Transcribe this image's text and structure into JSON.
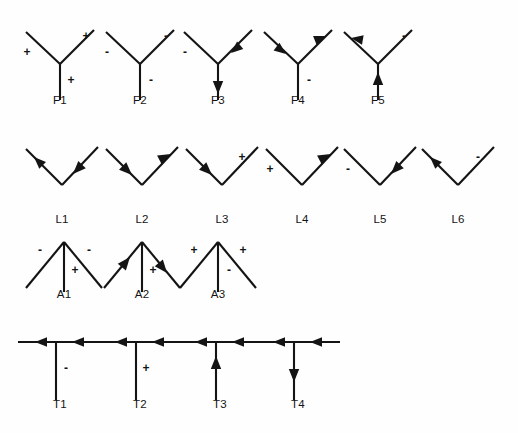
{
  "page": {
    "background_color": "#fefefe",
    "ink_color": "#141414"
  },
  "rows": [
    {
      "id": "row-fork",
      "family": "F",
      "junction_type": "fork",
      "y": 14,
      "figures": [
        {
          "label": "F1",
          "x": 14,
          "shape": "fork",
          "marks": [
            {
              "branch": "left",
              "kind": "sign",
              "value": "+"
            },
            {
              "branch": "right",
              "kind": "sign",
              "value": "+"
            },
            {
              "branch": "stem",
              "kind": "sign",
              "value": "+"
            }
          ]
        },
        {
          "label": "F2",
          "x": 94,
          "shape": "fork",
          "marks": [
            {
              "branch": "left",
              "kind": "sign",
              "value": "-"
            },
            {
              "branch": "right",
              "kind": "sign",
              "value": "-"
            },
            {
              "branch": "stem",
              "kind": "sign",
              "value": "-"
            }
          ]
        },
        {
          "label": "F3",
          "x": 172,
          "shape": "fork",
          "marks": [
            {
              "branch": "left",
              "kind": "sign",
              "value": "-"
            },
            {
              "branch": "right",
              "kind": "arrow",
              "value": "inward"
            },
            {
              "branch": "stem",
              "kind": "arrow",
              "value": "down"
            }
          ]
        },
        {
          "label": "F4",
          "x": 252,
          "shape": "fork",
          "marks": [
            {
              "branch": "left",
              "kind": "arrow",
              "value": "inward"
            },
            {
              "branch": "right",
              "kind": "arrow",
              "value": "outward"
            },
            {
              "branch": "stem",
              "kind": "sign",
              "value": "-"
            }
          ]
        },
        {
          "label": "F5",
          "x": 332,
          "shape": "fork",
          "marks": [
            {
              "branch": "left",
              "kind": "arrow",
              "value": "outward"
            },
            {
              "branch": "right",
              "kind": "sign",
              "value": "-"
            },
            {
              "branch": "stem",
              "kind": "arrow",
              "value": "up"
            }
          ]
        }
      ]
    },
    {
      "id": "row-ell",
      "family": "L",
      "junction_type": "ell",
      "y": 133,
      "figures": [
        {
          "label": "L1",
          "x": 16,
          "shape": "ell",
          "marks": [
            {
              "branch": "left",
              "kind": "arrow",
              "value": "outward"
            },
            {
              "branch": "right",
              "kind": "arrow",
              "value": "inward"
            }
          ]
        },
        {
          "label": "L2",
          "x": 96,
          "shape": "ell",
          "marks": [
            {
              "branch": "left",
              "kind": "arrow",
              "value": "inward"
            },
            {
              "branch": "right",
              "kind": "arrow",
              "value": "outward"
            }
          ]
        },
        {
          "label": "L3",
          "x": 176,
          "shape": "ell",
          "marks": [
            {
              "branch": "left",
              "kind": "arrow",
              "value": "inward"
            },
            {
              "branch": "right",
              "kind": "sign",
              "value": "+"
            }
          ]
        },
        {
          "label": "L4",
          "x": 256,
          "shape": "ell",
          "marks": [
            {
              "branch": "left",
              "kind": "sign",
              "value": "+"
            },
            {
              "branch": "right",
              "kind": "arrow",
              "value": "outward"
            }
          ]
        },
        {
          "label": "L5",
          "x": 334,
          "shape": "ell",
          "marks": [
            {
              "branch": "left",
              "kind": "sign",
              "value": "-"
            },
            {
              "branch": "right",
              "kind": "arrow",
              "value": "inward"
            }
          ]
        },
        {
          "label": "L6",
          "x": 412,
          "shape": "ell",
          "marks": [
            {
              "branch": "left",
              "kind": "arrow",
              "value": "outward"
            },
            {
              "branch": "right",
              "kind": "sign",
              "value": "-"
            }
          ]
        }
      ]
    },
    {
      "id": "row-arrow",
      "family": "A",
      "junction_type": "arrow",
      "y": 226,
      "figures": [
        {
          "label": "A1",
          "x": 18,
          "shape": "arrow",
          "marks": [
            {
              "branch": "left",
              "kind": "sign",
              "value": "-"
            },
            {
              "branch": "right",
              "kind": "sign",
              "value": "-"
            },
            {
              "branch": "stem",
              "kind": "sign",
              "value": "+"
            }
          ]
        },
        {
          "label": "A2",
          "x": 96,
          "shape": "arrow",
          "marks": [
            {
              "branch": "left",
              "kind": "arrow",
              "value": "inward"
            },
            {
              "branch": "right",
              "kind": "arrow",
              "value": "outward"
            },
            {
              "branch": "stem",
              "kind": "sign",
              "value": "+"
            }
          ]
        },
        {
          "label": "A3",
          "x": 172,
          "shape": "arrow",
          "marks": [
            {
              "branch": "left",
              "kind": "sign",
              "value": "+"
            },
            {
              "branch": "right",
              "kind": "sign",
              "value": "+"
            },
            {
              "branch": "stem",
              "kind": "sign",
              "value": "-"
            }
          ]
        }
      ]
    },
    {
      "id": "row-tee",
      "family": "T",
      "junction_type": "tee",
      "y": 326,
      "figures": [
        {
          "label": "T1",
          "x": 14,
          "shape": "tee",
          "marks": [
            {
              "branch": "bar-left",
              "kind": "arrow",
              "value": "left"
            },
            {
              "branch": "bar-right",
              "kind": "arrow",
              "value": "left"
            },
            {
              "branch": "stem",
              "kind": "sign",
              "value": "-"
            }
          ]
        },
        {
          "label": "T2",
          "x": 94,
          "shape": "tee",
          "marks": [
            {
              "branch": "bar-left",
              "kind": "arrow",
              "value": "left"
            },
            {
              "branch": "bar-right",
              "kind": "arrow",
              "value": "left"
            },
            {
              "branch": "stem",
              "kind": "sign",
              "value": "+"
            }
          ]
        },
        {
          "label": "T3",
          "x": 174,
          "shape": "tee",
          "marks": [
            {
              "branch": "bar-left",
              "kind": "arrow",
              "value": "left"
            },
            {
              "branch": "bar-right",
              "kind": "arrow",
              "value": "left"
            },
            {
              "branch": "stem",
              "kind": "arrow",
              "value": "up"
            }
          ]
        },
        {
          "label": "T4",
          "x": 252,
          "shape": "tee",
          "marks": [
            {
              "branch": "bar-left",
              "kind": "arrow",
              "value": "left"
            },
            {
              "branch": "bar-right",
              "kind": "arrow",
              "value": "left"
            },
            {
              "branch": "stem",
              "kind": "arrow",
              "value": "down"
            }
          ]
        }
      ]
    }
  ]
}
